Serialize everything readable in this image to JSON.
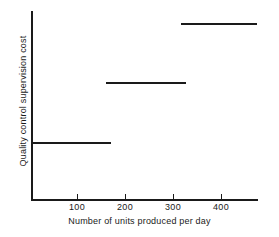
{
  "chart_data": {
    "type": "line",
    "subtype": "step",
    "title": "",
    "xlabel": "Number of units produced per day",
    "ylabel": "Quality control supervision cost",
    "xlim": [
      0,
      480
    ],
    "ylim": [
      0,
      100
    ],
    "xticks": [
      100,
      200,
      300,
      400
    ],
    "xtick_labels": [
      "100",
      "200",
      "300",
      "400"
    ],
    "yticks": [],
    "ytick_labels": [],
    "grid": false,
    "legend": false,
    "line_color": "#1a1a1a",
    "axis_color": "#1a1a1a",
    "background_color": "#ffffff",
    "series": [
      {
        "name": "Quality control supervision cost",
        "steps": [
          {
            "label": "step-1",
            "x_start": 0,
            "x_end": 170,
            "y": 31
          },
          {
            "label": "step-2",
            "x_start": 158,
            "x_end": 327,
            "y": 63
          },
          {
            "label": "step-3",
            "x_start": 318,
            "x_end": 478,
            "y": 94
          }
        ]
      }
    ]
  },
  "axes": {
    "x_title": "Number of units produced per day",
    "y_title": "Quality control supervision cost",
    "x_tick_labels": [
      "100",
      "200",
      "300",
      "400"
    ]
  }
}
